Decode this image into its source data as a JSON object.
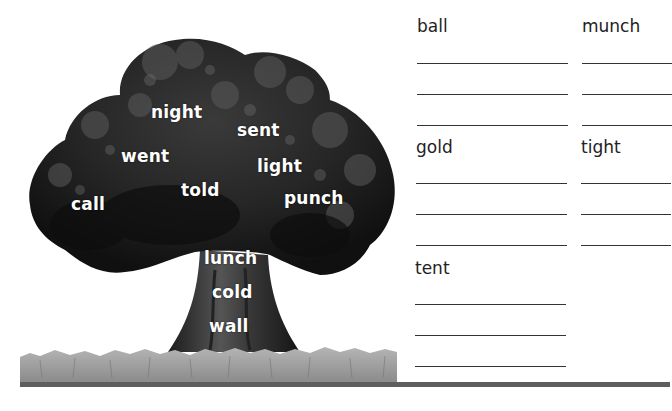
{
  "worksheet": {
    "tree_words": [
      {
        "text": "night",
        "x": 151,
        "y": 104
      },
      {
        "text": "sent",
        "x": 237,
        "y": 122
      },
      {
        "text": "went",
        "x": 121,
        "y": 148
      },
      {
        "text": "light",
        "x": 257,
        "y": 158
      },
      {
        "text": "told",
        "x": 181,
        "y": 182
      },
      {
        "text": "call",
        "x": 71,
        "y": 196
      },
      {
        "text": "punch",
        "x": 284,
        "y": 190
      },
      {
        "text": "lunch",
        "x": 204,
        "y": 250
      },
      {
        "text": "cold",
        "x": 212,
        "y": 284
      },
      {
        "text": "wall",
        "x": 209,
        "y": 318
      }
    ],
    "word_groups": [
      {
        "label": "ball",
        "x": 417,
        "y": 16,
        "line_width": 151,
        "lines": 3
      },
      {
        "label": "munch",
        "x": 582,
        "y": 16,
        "line_width": 90,
        "lines": 3
      },
      {
        "label": "gold",
        "x": 416,
        "y": 137,
        "line_width": 151,
        "lines": 3
      },
      {
        "label": "tight",
        "x": 581,
        "y": 137,
        "line_width": 90,
        "lines": 3
      },
      {
        "label": "tent",
        "x": 415,
        "y": 258,
        "line_width": 151,
        "lines": 3
      }
    ],
    "colors": {
      "text": "#222222",
      "rule_line": "#333333",
      "ground_bar": "#5e5e5e",
      "tree_dark": "#1a1a1a",
      "tree_mid": "#4a4a4a",
      "grass": "#9a9a9a"
    }
  }
}
